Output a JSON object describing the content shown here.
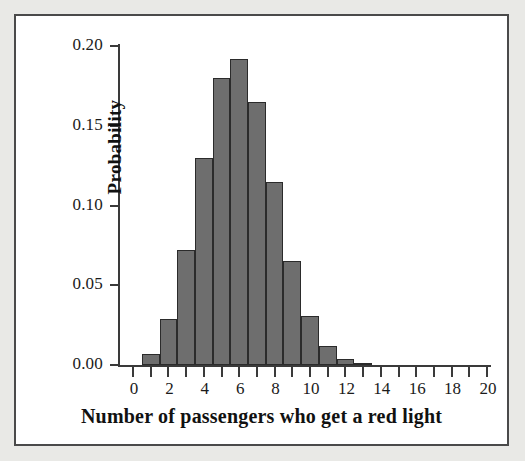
{
  "chart_data": {
    "type": "bar",
    "title": "",
    "xlabel": "Number of passengers who get a red light",
    "ylabel": "Probability",
    "categories": [
      0,
      1,
      2,
      3,
      4,
      5,
      6,
      7,
      8,
      9,
      10,
      11,
      12,
      13,
      14,
      15,
      16,
      17,
      18,
      19,
      20
    ],
    "values": [
      0.0,
      0.007,
      0.029,
      0.072,
      0.13,
      0.18,
      0.192,
      0.165,
      0.115,
      0.065,
      0.031,
      0.012,
      0.004,
      0.001,
      0.0,
      0.0,
      0.0,
      0.0,
      0.0,
      0.0,
      0.0
    ],
    "xlim": [
      0,
      20
    ],
    "ylim": [
      0.0,
      0.2
    ],
    "x_tick_labels": [
      "0",
      "2",
      "4",
      "6",
      "8",
      "10",
      "12",
      "14",
      "16",
      "18",
      "20"
    ],
    "x_tick_values": [
      0,
      2,
      4,
      6,
      8,
      10,
      12,
      14,
      16,
      18,
      20
    ],
    "x_minor_tick_values": [
      1,
      3,
      5,
      7,
      9,
      11,
      13,
      15,
      17,
      19
    ],
    "y_tick_labels": [
      "0.00",
      "0.05",
      "0.10",
      "0.15",
      "0.20"
    ],
    "y_tick_values": [
      0.0,
      0.05,
      0.1,
      0.15,
      0.2
    ],
    "grid": false,
    "legend": false,
    "bar_fill_color": "#6e6e6e",
    "bar_edge_color": "#2b2b2b",
    "axis_color": "#3a3a3a",
    "plot_background": "#ffffff",
    "page_background": "#e9e9e6",
    "frame_border_color": "#4a4a4a"
  }
}
